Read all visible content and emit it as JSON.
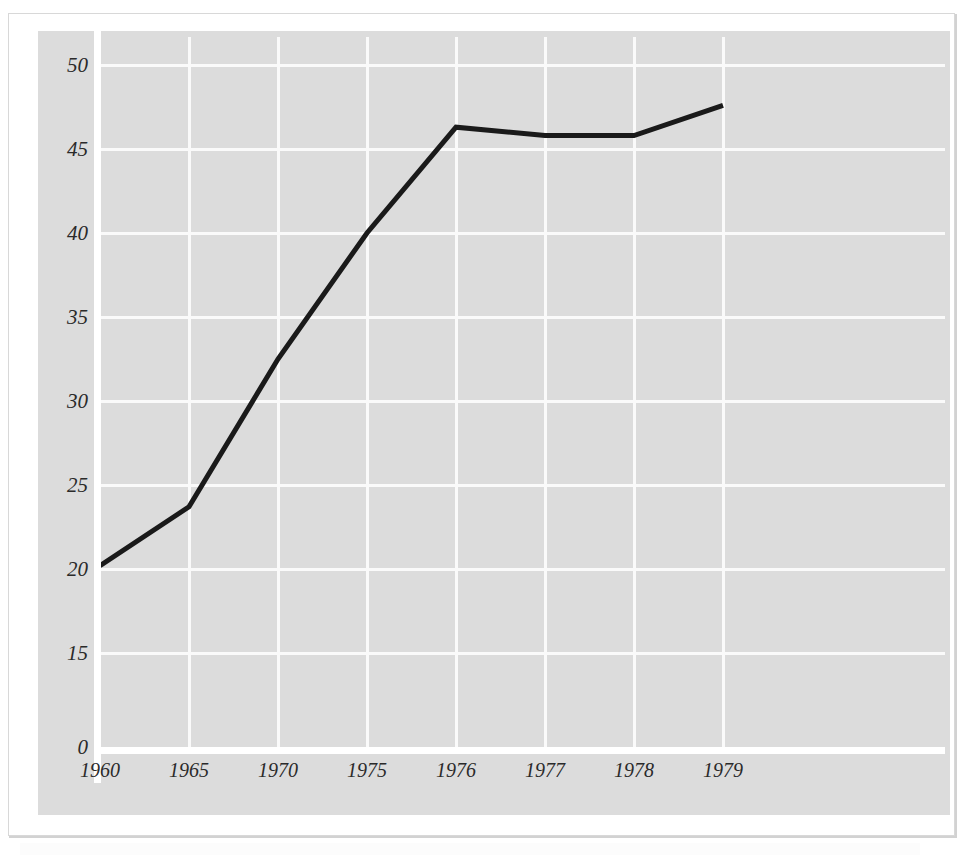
{
  "figure": {
    "background_color": "#ffffff",
    "panel_color": "#dcdcdc",
    "gridline_color": "#fafafa",
    "axis_color": "#ffffff",
    "line_color": "#1a1a1a",
    "frame_border_color": "#d8d8d8"
  },
  "chart_data": {
    "type": "line",
    "title": "",
    "subtitle": "",
    "xlabel": "",
    "ylabel": "",
    "categories": [
      "1960",
      "1965",
      "1970",
      "1975",
      "1976",
      "1977",
      "1978",
      "1979"
    ],
    "x": [
      1960,
      1965,
      1970,
      1975,
      1976,
      1977,
      1978,
      1979
    ],
    "values": [
      20.2,
      23.7,
      32.5,
      40.0,
      46.3,
      45.8,
      45.8,
      47.6
    ],
    "series": [
      {
        "name": "",
        "values": [
          20.2,
          23.7,
          32.5,
          40.0,
          46.3,
          45.8,
          45.8,
          47.6
        ]
      }
    ],
    "ylim": [
      0,
      51
    ],
    "yticks": [
      0,
      15,
      20,
      25,
      30,
      35,
      40,
      45,
      50
    ],
    "ytick_labels": [
      "0",
      "15",
      "20",
      "25",
      "30",
      "35",
      "40",
      "45",
      "50"
    ],
    "xtick_labels": [
      "1960",
      "1965",
      "1970",
      "1975",
      "1976",
      "1977",
      "1978",
      "1979"
    ],
    "grid": true,
    "grid_axis": "both",
    "legend": false,
    "legend_position": "none",
    "annotations": []
  },
  "axes": {
    "y_ticks": [
      {
        "label": "50",
        "value": 50
      },
      {
        "label": "45",
        "value": 45
      },
      {
        "label": "40",
        "value": 40
      },
      {
        "label": "35",
        "value": 35
      },
      {
        "label": "30",
        "value": 30
      },
      {
        "label": "25",
        "value": 25
      },
      {
        "label": "20",
        "value": 20
      },
      {
        "label": "15",
        "value": 15
      },
      {
        "label": "0",
        "value": 0
      }
    ],
    "x_ticks": [
      {
        "label": "1960",
        "value": 1960
      },
      {
        "label": "1965",
        "value": 1965
      },
      {
        "label": "1970",
        "value": 1970
      },
      {
        "label": "1975",
        "value": 1975
      },
      {
        "label": "1976",
        "value": 1976
      },
      {
        "label": "1977",
        "value": 1977
      },
      {
        "label": "1978",
        "value": 1978
      },
      {
        "label": "1979",
        "value": 1979
      }
    ]
  }
}
